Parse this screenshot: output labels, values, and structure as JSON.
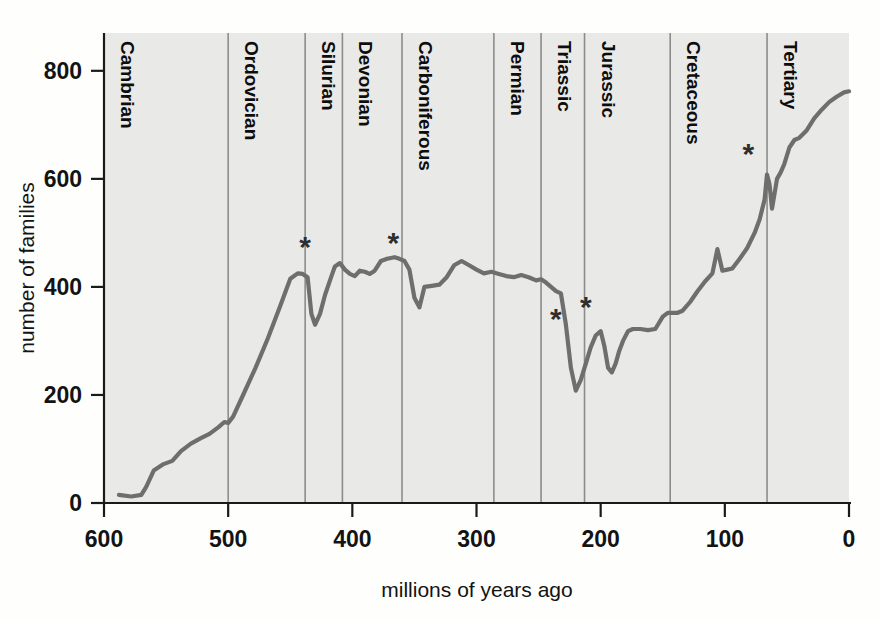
{
  "chart_data": {
    "type": "line",
    "title": "",
    "xlabel": "millions of years ago",
    "ylabel": "number of families",
    "xlim": [
      600,
      0
    ],
    "ylim": [
      0,
      870
    ],
    "x_ticks": [
      600,
      500,
      400,
      300,
      200,
      100,
      0
    ],
    "x_tick_labels": [
      "600",
      "500",
      "400",
      "300",
      "200",
      "100",
      "0"
    ],
    "y_ticks": [
      0,
      200,
      400,
      600,
      800
    ],
    "y_tick_labels": [
      "0",
      "200",
      "400",
      "600",
      "800"
    ],
    "grid": false,
    "x_axis_reversed": true,
    "legend": "none",
    "line_color": "#6e6e6e",
    "plot_background": "#e9e9e7",
    "series": [
      {
        "name": "marine animal families",
        "points": [
          [
            588,
            15
          ],
          [
            578,
            12
          ],
          [
            570,
            15
          ],
          [
            566,
            30
          ],
          [
            560,
            60
          ],
          [
            552,
            72
          ],
          [
            545,
            78
          ],
          [
            538,
            96
          ],
          [
            530,
            110
          ],
          [
            522,
            120
          ],
          [
            515,
            128
          ],
          [
            508,
            140
          ],
          [
            503,
            150
          ],
          [
            500,
            148
          ],
          [
            496,
            160
          ],
          [
            488,
            200
          ],
          [
            478,
            250
          ],
          [
            468,
            305
          ],
          [
            458,
            365
          ],
          [
            450,
            415
          ],
          [
            444,
            425
          ],
          [
            440,
            424
          ],
          [
            436,
            418
          ],
          [
            433,
            350
          ],
          [
            430,
            330
          ],
          [
            426,
            350
          ],
          [
            422,
            385
          ],
          [
            418,
            412
          ],
          [
            414,
            438
          ],
          [
            410,
            444
          ],
          [
            406,
            432
          ],
          [
            402,
            424
          ],
          [
            398,
            420
          ],
          [
            394,
            430
          ],
          [
            390,
            428
          ],
          [
            386,
            424
          ],
          [
            382,
            430
          ],
          [
            377,
            448
          ],
          [
            372,
            452
          ],
          [
            366,
            455
          ],
          [
            362,
            452
          ],
          [
            358,
            448
          ],
          [
            354,
            432
          ],
          [
            350,
            380
          ],
          [
            346,
            362
          ],
          [
            342,
            400
          ],
          [
            336,
            402
          ],
          [
            330,
            404
          ],
          [
            324,
            418
          ],
          [
            318,
            440
          ],
          [
            312,
            448
          ],
          [
            306,
            440
          ],
          [
            300,
            432
          ],
          [
            294,
            425
          ],
          [
            288,
            428
          ],
          [
            282,
            424
          ],
          [
            276,
            420
          ],
          [
            270,
            418
          ],
          [
            264,
            422
          ],
          [
            258,
            418
          ],
          [
            252,
            412
          ],
          [
            248,
            414
          ],
          [
            244,
            408
          ],
          [
            240,
            400
          ],
          [
            236,
            392
          ],
          [
            232,
            388
          ],
          [
            228,
            330
          ],
          [
            224,
            250
          ],
          [
            220,
            208
          ],
          [
            216,
            228
          ],
          [
            212,
            258
          ],
          [
            208,
            288
          ],
          [
            204,
            310
          ],
          [
            200,
            318
          ],
          [
            197,
            290
          ],
          [
            194,
            250
          ],
          [
            191,
            242
          ],
          [
            188,
            258
          ],
          [
            185,
            282
          ],
          [
            182,
            300
          ],
          [
            178,
            318
          ],
          [
            174,
            322
          ],
          [
            168,
            322
          ],
          [
            162,
            320
          ],
          [
            156,
            322
          ],
          [
            150,
            345
          ],
          [
            146,
            352
          ],
          [
            142,
            352
          ],
          [
            138,
            352
          ],
          [
            134,
            356
          ],
          [
            128,
            372
          ],
          [
            122,
            392
          ],
          [
            116,
            410
          ],
          [
            110,
            425
          ],
          [
            106,
            470
          ],
          [
            102,
            430
          ],
          [
            98,
            432
          ],
          [
            94,
            434
          ],
          [
            88,
            452
          ],
          [
            82,
            472
          ],
          [
            76,
            500
          ],
          [
            72,
            525
          ],
          [
            68,
            562
          ],
          [
            66,
            608
          ],
          [
            64,
            590
          ],
          [
            62,
            545
          ],
          [
            60,
            572
          ],
          [
            58,
            600
          ],
          [
            55,
            612
          ],
          [
            52,
            628
          ],
          [
            48,
            658
          ],
          [
            44,
            672
          ],
          [
            40,
            676
          ],
          [
            34,
            690
          ],
          [
            28,
            712
          ],
          [
            22,
            728
          ],
          [
            16,
            742
          ],
          [
            10,
            752
          ],
          [
            4,
            760
          ],
          [
            0,
            762
          ]
        ]
      }
    ],
    "mass_extinction_markers": [
      {
        "label": "*",
        "x": 438,
        "y": 455,
        "note": "end-Ordovician"
      },
      {
        "label": "*",
        "x": 367,
        "y": 462,
        "note": "late Devonian"
      },
      {
        "label": "*",
        "x": 236,
        "y": 322,
        "note": "end-Permian"
      },
      {
        "label": "*",
        "x": 212,
        "y": 345,
        "note": "end-Triassic"
      },
      {
        "label": "*",
        "x": 81,
        "y": 628,
        "note": "end-Cretaceous"
      }
    ],
    "periods": [
      {
        "label": "Cambrian",
        "start": 600,
        "end": 500
      },
      {
        "label": "Ordovician",
        "start": 500,
        "end": 438
      },
      {
        "label": "Silurian",
        "start": 438,
        "end": 408
      },
      {
        "label": "Devonian",
        "start": 408,
        "end": 360
      },
      {
        "label": "Carboniferous",
        "start": 360,
        "end": 286
      },
      {
        "label": "Permian",
        "start": 286,
        "end": 248
      },
      {
        "label": "Triassic",
        "start": 248,
        "end": 213
      },
      {
        "label": "Jurassic",
        "start": 213,
        "end": 144
      },
      {
        "label": "Cretaceous",
        "start": 144,
        "end": 66
      },
      {
        "label": "Tertiary",
        "start": 66,
        "end": 0
      }
    ],
    "period_boundaries": [
      500,
      438,
      408,
      360,
      286,
      248,
      213,
      144,
      66
    ]
  }
}
